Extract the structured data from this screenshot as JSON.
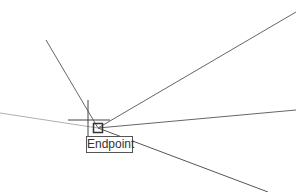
{
  "canvas": {
    "background": "#ffffff",
    "lines": [
      {
        "id": "upper-left-line",
        "x1": 46,
        "y1": 40,
        "x2": 98,
        "y2": 128,
        "color": "#666666"
      },
      {
        "id": "top-right-line",
        "x1": 98,
        "y1": 128,
        "x2": 296,
        "y2": 12,
        "color": "#666666"
      },
      {
        "id": "middle-right-line",
        "x1": 98,
        "y1": 128,
        "x2": 296,
        "y2": 110,
        "color": "#666666"
      },
      {
        "id": "bottom-right-line",
        "x1": 98,
        "y1": 128,
        "x2": 268,
        "y2": 192,
        "color": "#555555"
      },
      {
        "id": "left-line",
        "x1": 0,
        "y1": 113,
        "x2": 98,
        "y2": 128,
        "color": "#b0b0b0"
      }
    ],
    "crosshair": {
      "x": 88,
      "y": 120,
      "color": "#444444"
    },
    "snap_marker": {
      "x": 93,
      "y": 123,
      "size": 10,
      "color": "#333333"
    }
  },
  "tooltip": {
    "label": "Endpoint"
  }
}
